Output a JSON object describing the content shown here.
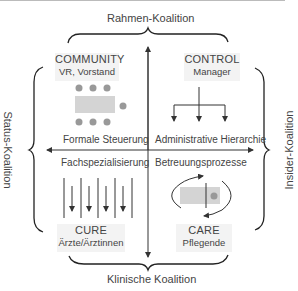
{
  "coalitions": {
    "top": "Rahmen-Koalition",
    "bottom": "Klinische Koalition",
    "left": "Status-Koalition",
    "right": "Insider-Koalition"
  },
  "quadrants": {
    "community": {
      "title": "COMMUNITY",
      "subtitle": "VR, Vorstand",
      "caption": "Formale Steuerung",
      "icon": "board-table-icon"
    },
    "control": {
      "title": "CONTROL",
      "subtitle": "Manager",
      "caption": "Administrative Hierarchie",
      "icon": "hierarchy-tree-icon"
    },
    "cure": {
      "title": "CURE",
      "subtitle": "Ärzte/Ärztinnen",
      "caption": "Fachspezialisierung",
      "icon": "specialization-columns-icon"
    },
    "care": {
      "title": "CARE",
      "subtitle": "Pflegende",
      "caption": "Betreuungsprozesse",
      "icon": "care-cycle-icon"
    }
  },
  "colors": {
    "line": "#333333",
    "box_fill": "#f3f3f3",
    "icon_fill": "#d0d0d0",
    "dot": "#999999"
  }
}
